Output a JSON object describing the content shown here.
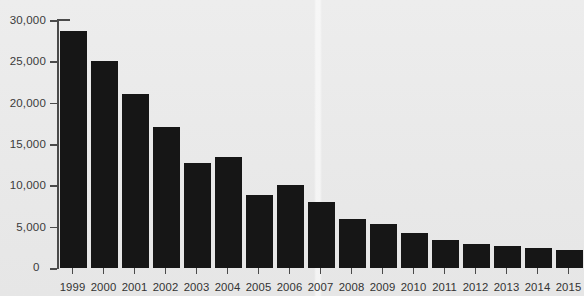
{
  "chart_data": {
    "type": "bar",
    "title": "",
    "subtitle": "",
    "xlabel": "",
    "ylabel": "",
    "categories": [
      "1999",
      "2000",
      "2001",
      "2002",
      "2003",
      "2004",
      "2005",
      "2006",
      "2007",
      "2008",
      "2009",
      "2010",
      "2011",
      "2012",
      "2013",
      "2014",
      "2015"
    ],
    "values": [
      28700,
      25000,
      21000,
      17000,
      12700,
      13400,
      8800,
      10000,
      8000,
      5900,
      5300,
      4200,
      3400,
      2900,
      2700,
      2400,
      2200
    ],
    "ylim": [
      0,
      30000
    ],
    "ytick_values": [
      0,
      5000,
      10000,
      15000,
      20000,
      25000,
      30000
    ],
    "ytick_labels": [
      "0",
      "5,000",
      "10,000",
      "15,000",
      "20,000",
      "25,000",
      "30,000"
    ],
    "grid": false,
    "legend": null,
    "legend_position": "none",
    "bar_color": "#161616",
    "background_color": "#ebebeb",
    "axis_color": "#4a4a4a"
  }
}
